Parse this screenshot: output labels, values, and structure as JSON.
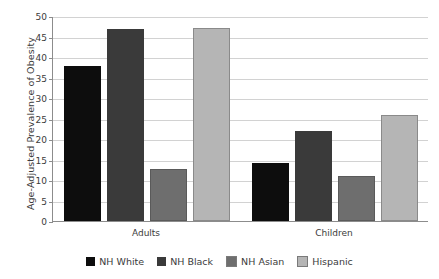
{
  "chart_data": {
    "type": "bar",
    "title": "",
    "subtitle": "",
    "xlabel": "",
    "ylabel": "Age-Adjusted Prevalence of Obesity",
    "categories": [
      "Adults",
      "Children"
    ],
    "ylim": [
      0,
      50
    ],
    "ytick_step": 5,
    "yticks": [
      "0",
      "5",
      "10",
      "15",
      "20",
      "25",
      "30",
      "35",
      "40",
      "45",
      "50"
    ],
    "grid": true,
    "legend_position": "bottom",
    "series": [
      {
        "name": "NH White",
        "color": "#0d0d0d",
        "values": [
          37.9,
          14.1
        ]
      },
      {
        "name": "NH Black",
        "color": "#3a3a3a",
        "values": [
          46.8,
          22.0
        ]
      },
      {
        "name": "NH Asian",
        "color": "#6e6e6e",
        "values": [
          12.7,
          11.0
        ]
      },
      {
        "name": "Hispanic",
        "color": "#b5b5b5",
        "values": [
          47.0,
          25.8
        ]
      }
    ]
  },
  "figure": {
    "background_color": "#ffffff",
    "axis_color": "#8c8c8c",
    "gridline_color": "#d2d2d2",
    "text_color": "#3b3b3b"
  }
}
